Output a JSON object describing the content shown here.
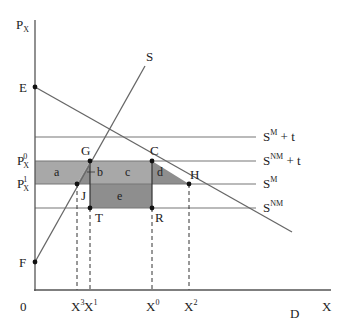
{
  "figure": {
    "type": "economics-diagram",
    "axes": {
      "y_label": "P",
      "y_label_sub": "X",
      "x_label": "X",
      "origin_label": "0"
    },
    "price_labels": [
      {
        "base": "P",
        "sup": "0",
        "sub": "X",
        "y": 161
      },
      {
        "base": "P",
        "sup": "1",
        "sub": "X",
        "y": 184
      }
    ],
    "quantity_labels": [
      {
        "base": "X",
        "sup": "3",
        "x": 77
      },
      {
        "base": "X",
        "sup": "1",
        "x": 90
      },
      {
        "base": "X",
        "sup": "0",
        "x": 152
      },
      {
        "base": "X",
        "sup": "2",
        "x": 189
      }
    ],
    "curves": {
      "supply": {
        "label": "S"
      },
      "demand": {
        "label": "D"
      }
    },
    "horizontal_lines": [
      {
        "base": "S",
        "sup": "M",
        "suffix": " + t",
        "y": 137
      },
      {
        "base": "S",
        "sup": "NM",
        "suffix": " + t",
        "y": 161
      },
      {
        "base": "S",
        "sup": "M",
        "suffix": "",
        "y": 184
      },
      {
        "base": "S",
        "sup": "NM",
        "suffix": "",
        "y": 208
      }
    ],
    "points": [
      {
        "label": "E"
      },
      {
        "label": "F"
      },
      {
        "label": "G"
      },
      {
        "label": "C"
      },
      {
        "label": "H"
      },
      {
        "label": "J"
      },
      {
        "label": "T"
      },
      {
        "label": "R"
      }
    ],
    "regions": [
      {
        "label": "a"
      },
      {
        "label": "b"
      },
      {
        "label": "c"
      },
      {
        "label": "d"
      },
      {
        "label": "e"
      }
    ],
    "colors": {
      "axis": "#333333",
      "line": "#666666",
      "region_light": "#a6a6a6",
      "region_dark": "#8c8c8c",
      "point": "#111111"
    }
  }
}
